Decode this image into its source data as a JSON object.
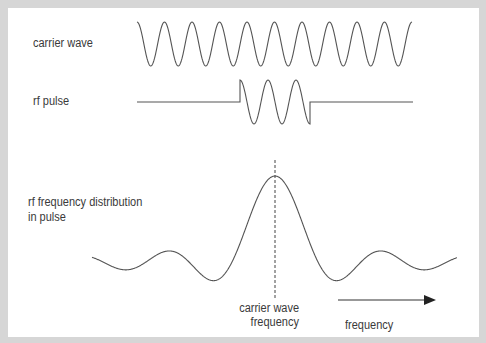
{
  "labels": {
    "carrier_wave": "carrier wave",
    "rf_pulse": "rf pulse",
    "distribution_line1": "rf frequency distribution",
    "distribution_line2": "in pulse",
    "carrier_freq_line1": "carrier wave",
    "carrier_freq_line2": "frequency",
    "frequency_axis": "frequency"
  },
  "colors": {
    "frame": "#d6d6d6",
    "panel": "#ffffff",
    "line": "#555555",
    "text": "#3a3a3a"
  }
}
